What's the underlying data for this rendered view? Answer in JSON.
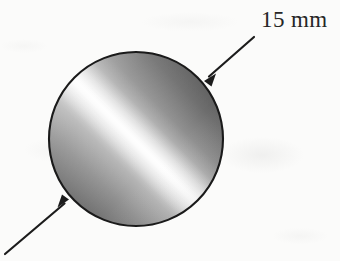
{
  "figure": {
    "background_color": "#fbfbfa"
  },
  "annotations": {
    "diameter_label": "15 mm"
  },
  "shape": {
    "name": "rod-cross-section",
    "form": "circle",
    "center_x": 136,
    "center_y": 139,
    "diameter_px": 176,
    "outline_color": "#1a1a1a",
    "outline_width": 2,
    "fill_style": "metallic-diagonal-gradient",
    "gradient_angle_deg": 45,
    "gradient_dark_color": "#4a4a4a",
    "gradient_mid_color": "#9a9a9a",
    "gradient_light_color": "#f4f4f4"
  },
  "leaders": [
    {
      "name": "upper-right-leader",
      "tail_x": 254,
      "tail_y": 37,
      "tip_x": 205,
      "tip_y": 80,
      "color": "#1c1c1c"
    },
    {
      "name": "lower-left-leader",
      "tail_x": 5,
      "tail_y": 254,
      "tip_x": 68,
      "tip_y": 200,
      "color": "#1c1c1c"
    }
  ]
}
